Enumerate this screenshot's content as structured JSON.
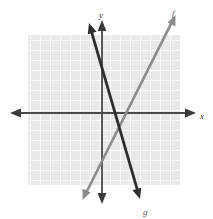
{
  "figure": {
    "kind": "coordinate-plane-graph",
    "background_color": "#ffffff",
    "grid": {
      "fill_color": "#e9e9e9",
      "line_color": "#ffffff",
      "cell_size_px": 10,
      "left_px": 28,
      "top_px": 35,
      "width_px": 152,
      "height_px": 150,
      "columns": 15,
      "rows": 15,
      "visible": true
    },
    "axes": {
      "color": "#4a4a4a",
      "origin_px": {
        "x": 102,
        "y": 113
      },
      "x_axis": {
        "label": "x",
        "label_pos_px": {
          "x": 203,
          "y": 116
        },
        "start_px": {
          "x": 12,
          "y": 113
        },
        "end_px": {
          "x": 194,
          "y": 113
        },
        "arrow_both_ends": true
      },
      "y_axis": {
        "label": "y",
        "label_pos_px": {
          "x": 101,
          "y": 14
        },
        "start_px": {
          "x": 102,
          "y": 22
        },
        "end_px": {
          "x": 102,
          "y": 201
        },
        "arrow_both_ends": true
      }
    }
  },
  "chart_data": {
    "type": "line",
    "title": "",
    "xlabel": "x",
    "ylabel": "y",
    "grid": true,
    "legend": "inline-labels",
    "xlim": [
      -7.4,
      9.2
    ],
    "ylim": [
      -8.8,
      9.1
    ],
    "annotations": [
      {
        "text": "f",
        "x_px": 175,
        "y_px": 12
      },
      {
        "text": "g",
        "x_px": 146,
        "y_px": 212
      },
      {
        "text": "x",
        "x_px": 203,
        "y_px": 116
      },
      {
        "text": "y",
        "x_px": 101,
        "y_px": 14
      }
    ],
    "series": [
      {
        "name": "f",
        "label": "f",
        "color": "#8c8c8c",
        "stroke_width_px": 2.6,
        "slope": 2.0,
        "y_intercept": -1.4,
        "x_intercept": 0.7,
        "arrow_both_ends": true,
        "endpoints_px": [
          {
            "x": 83,
            "y": 199
          },
          {
            "x": 175,
            "y": 16
          }
        ],
        "points": [
          {
            "x": -1.9,
            "y": -8.6
          },
          {
            "x": 7.3,
            "y": 9.7
          }
        ]
      },
      {
        "name": "g",
        "label": "g",
        "color": "#2e2e2e",
        "stroke_width_px": 2.8,
        "slope": -3.5,
        "y_intercept": 3.2,
        "x_intercept": 0.9,
        "arrow_both_ends": true,
        "endpoints_px": [
          {
            "x": 89,
            "y": 23
          },
          {
            "x": 140,
            "y": 199
          }
        ],
        "points": [
          {
            "x": -1.3,
            "y": 9.0
          },
          {
            "x": 3.8,
            "y": -8.6
          }
        ]
      }
    ],
    "intersection_px": {
      "x": 106,
      "y": 127
    },
    "intersection": {
      "x": 0.4,
      "y": -1.4
    }
  }
}
